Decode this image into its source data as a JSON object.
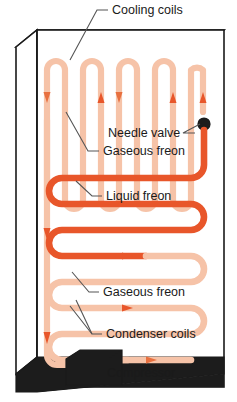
{
  "diagram": {
    "colors": {
      "liquid_freon": "#E8562A",
      "gaseous_freon": "#F6C3A8",
      "cabinet_outline": "#1a1a1a",
      "compressor_fill": "#1c1c1c",
      "base_fill": "#1c1c1c",
      "valve_dot": "#1c1c1c",
      "label_text": "#1a1a1a",
      "leader_line": "#555555",
      "arrow_liquid": "#E8562A",
      "arrow_gas": "#E8703F",
      "background": "#ffffff"
    },
    "labels": [
      {
        "id": "cooling-coils",
        "text": "Cooling coils",
        "x": 112,
        "y": 14,
        "anchor": "start"
      },
      {
        "id": "needle-valve",
        "text": "Needle valve",
        "x": 108,
        "y": 137,
        "anchor": "start"
      },
      {
        "id": "gaseous-freon-1",
        "text": "Gaseous freon",
        "x": 103,
        "y": 155,
        "anchor": "start"
      },
      {
        "id": "liquid-freon",
        "text": "Liquid freon",
        "x": 106,
        "y": 200,
        "anchor": "start"
      },
      {
        "id": "gaseous-freon-2",
        "text": "Gaseous freon",
        "x": 103,
        "y": 296,
        "anchor": "start"
      },
      {
        "id": "condenser-coils",
        "text": "Condenser coils",
        "x": 106,
        "y": 338,
        "anchor": "start"
      },
      {
        "id": "compressor",
        "text": "Compressor",
        "x": 107,
        "y": 377,
        "anchor": "start"
      }
    ],
    "components": [
      {
        "id": "cooling-coils",
        "kind": "evaporator-serpentine-vertical",
        "state": "gaseous"
      },
      {
        "id": "needle-valve",
        "kind": "expansion-valve",
        "state": "throttle"
      },
      {
        "id": "condenser-coils",
        "kind": "condenser-serpentine-horizontal",
        "state": "liquid-to-gaseous"
      },
      {
        "id": "compressor",
        "kind": "compressor-block",
        "state": "solid"
      }
    ],
    "flow_arrows": [
      {
        "id": "arrow-top-1",
        "direction": "down",
        "state": "gaseous"
      },
      {
        "id": "arrow-top-2",
        "direction": "up",
        "state": "gaseous"
      },
      {
        "id": "arrow-top-3",
        "direction": "down",
        "state": "gaseous"
      },
      {
        "id": "arrow-top-4",
        "direction": "up",
        "state": "gaseous"
      },
      {
        "id": "arrow-liquid-mid",
        "direction": "left",
        "state": "liquid"
      },
      {
        "id": "arrow-gas-mid-1",
        "direction": "right",
        "state": "gaseous"
      },
      {
        "id": "arrow-gas-mid-2",
        "direction": "right",
        "state": "gaseous"
      },
      {
        "id": "arrow-return-1",
        "direction": "down",
        "state": "gaseous"
      },
      {
        "id": "arrow-return-2",
        "direction": "down",
        "state": "gaseous"
      },
      {
        "id": "arrow-bottom",
        "direction": "right",
        "state": "gaseous"
      }
    ]
  }
}
